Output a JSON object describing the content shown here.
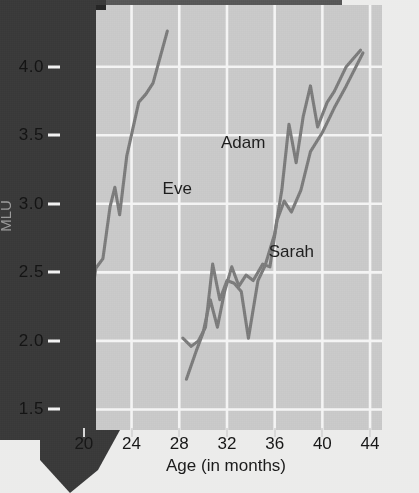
{
  "chart_data": {
    "type": "line",
    "title": "",
    "xlabel": "Age (in months)",
    "ylabel": "MLU",
    "xlim": [
      18,
      45
    ],
    "ylim": [
      1.35,
      4.45
    ],
    "xticks": [
      20,
      24,
      28,
      32,
      36,
      40,
      44
    ],
    "xtick_labels": [
      "20",
      "24",
      "28",
      "32",
      "36",
      "40",
      "44"
    ],
    "yticks": [
      1.5,
      2.0,
      2.5,
      3.0,
      3.5,
      4.0
    ],
    "ytick_labels": [
      "1.5",
      "2.0",
      "2.5",
      "3.0",
      "3.5",
      "4.0"
    ],
    "grid": true,
    "grid_color": "#f4f4f4",
    "plot_bg": "#c9c9c9",
    "line_color": "#7c7c7c",
    "legend": "inline-annotations",
    "series": [
      {
        "name": "Eve",
        "label_x": 26.6,
        "label_y": 3.18,
        "points": [
          [
            18.5,
            1.5
          ],
          [
            19.5,
            1.82
          ],
          [
            20.5,
            2.22
          ],
          [
            21.0,
            2.53
          ],
          [
            21.6,
            2.6
          ],
          [
            22.2,
            2.98
          ],
          [
            22.6,
            3.12
          ],
          [
            23.0,
            2.92
          ],
          [
            23.6,
            3.35
          ],
          [
            24.6,
            3.74
          ],
          [
            25.2,
            3.8
          ],
          [
            25.8,
            3.88
          ],
          [
            27.0,
            4.26
          ]
        ]
      },
      {
        "name": "Adam",
        "label_x": 31.5,
        "label_y": 3.52,
        "points": [
          [
            28.3,
            2.02
          ],
          [
            29.0,
            1.96
          ],
          [
            29.6,
            2.0
          ],
          [
            30.2,
            2.1
          ],
          [
            30.8,
            2.56
          ],
          [
            31.4,
            2.3
          ],
          [
            32.0,
            2.44
          ],
          [
            32.6,
            2.42
          ],
          [
            33.2,
            2.36
          ],
          [
            33.8,
            2.02
          ],
          [
            34.6,
            2.44
          ],
          [
            35.2,
            2.55
          ],
          [
            36.0,
            2.78
          ],
          [
            36.6,
            3.1
          ],
          [
            37.2,
            3.58
          ],
          [
            37.8,
            3.3
          ],
          [
            38.4,
            3.64
          ],
          [
            39.0,
            3.86
          ],
          [
            39.6,
            3.56
          ],
          [
            40.4,
            3.74
          ],
          [
            41.0,
            3.82
          ],
          [
            42.0,
            4.0
          ],
          [
            43.2,
            4.12
          ]
        ]
      },
      {
        "name": "Sarah",
        "label_x": 35.5,
        "label_y": 2.72,
        "points": [
          [
            28.6,
            1.72
          ],
          [
            29.4,
            1.92
          ],
          [
            30.0,
            2.06
          ],
          [
            30.6,
            2.3
          ],
          [
            31.2,
            2.1
          ],
          [
            31.8,
            2.36
          ],
          [
            32.4,
            2.54
          ],
          [
            33.0,
            2.4
          ],
          [
            33.6,
            2.48
          ],
          [
            34.2,
            2.44
          ],
          [
            35.0,
            2.56
          ],
          [
            35.6,
            2.54
          ],
          [
            36.2,
            2.88
          ],
          [
            36.8,
            3.02
          ],
          [
            37.4,
            2.94
          ],
          [
            38.2,
            3.1
          ],
          [
            39.0,
            3.38
          ],
          [
            40.0,
            3.52
          ],
          [
            41.0,
            3.7
          ],
          [
            42.0,
            3.86
          ],
          [
            43.4,
            4.1
          ]
        ]
      }
    ]
  }
}
